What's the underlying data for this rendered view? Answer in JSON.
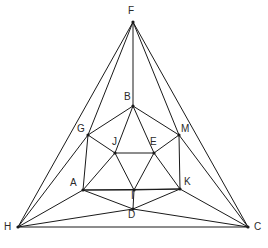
{
  "figure": {
    "background_color": "#ffffff",
    "line_color": "#1a1a1a",
    "label_color": "#2a2a2a",
    "width": 268,
    "height": 248,
    "vertices": [
      {
        "id": "F",
        "label": "F",
        "x": 133,
        "y": 22,
        "label_x": 128,
        "label_y": 6,
        "dot": true
      },
      {
        "id": "H",
        "label": "H",
        "x": 18,
        "y": 227,
        "label_x": 4,
        "label_y": 222,
        "dot": true
      },
      {
        "id": "C",
        "label": "C",
        "x": 248,
        "y": 227,
        "label_x": 254,
        "label_y": 222,
        "dot": true
      },
      {
        "id": "B",
        "label": "B",
        "x": 133,
        "y": 106,
        "label_x": 124,
        "label_y": 92,
        "dot": true
      },
      {
        "id": "G",
        "label": "G",
        "x": 88,
        "y": 135,
        "label_x": 77,
        "label_y": 124,
        "dot": true
      },
      {
        "id": "M",
        "label": "M",
        "x": 179,
        "y": 135,
        "label_x": 181,
        "label_y": 124,
        "dot": true
      },
      {
        "id": "J",
        "label": "J",
        "x": 115,
        "y": 153,
        "label_x": 112,
        "label_y": 137,
        "dot": true
      },
      {
        "id": "E",
        "label": "E",
        "x": 154,
        "y": 153,
        "label_x": 150,
        "label_y": 137,
        "dot": true
      },
      {
        "id": "A",
        "label": "A",
        "x": 83,
        "y": 190,
        "label_x": 70,
        "label_y": 178,
        "dot": true
      },
      {
        "id": "K",
        "label": "K",
        "x": 180,
        "y": 189,
        "label_x": 184,
        "label_y": 177,
        "dot": true
      },
      {
        "id": "I",
        "label": "I",
        "x": 134,
        "y": 190,
        "label_x": 131,
        "label_y": 191,
        "dot": true
      },
      {
        "id": "D",
        "label": "D",
        "x": 133,
        "y": 209,
        "label_x": 128,
        "label_y": 210,
        "dot": true
      }
    ],
    "edges": [
      {
        "from": "F",
        "to": "H"
      },
      {
        "from": "F",
        "to": "C"
      },
      {
        "from": "H",
        "to": "C"
      },
      {
        "from": "F",
        "to": "G"
      },
      {
        "from": "F",
        "to": "B"
      },
      {
        "from": "F",
        "to": "M"
      },
      {
        "from": "H",
        "to": "G"
      },
      {
        "from": "H",
        "to": "A"
      },
      {
        "from": "H",
        "to": "D"
      },
      {
        "from": "C",
        "to": "M"
      },
      {
        "from": "C",
        "to": "K"
      },
      {
        "from": "C",
        "to": "D"
      },
      {
        "from": "B",
        "to": "G"
      },
      {
        "from": "B",
        "to": "M"
      },
      {
        "from": "B",
        "to": "J"
      },
      {
        "from": "B",
        "to": "E"
      },
      {
        "from": "G",
        "to": "A"
      },
      {
        "from": "G",
        "to": "J"
      },
      {
        "from": "M",
        "to": "K"
      },
      {
        "from": "M",
        "to": "E"
      },
      {
        "from": "J",
        "to": "E"
      },
      {
        "from": "J",
        "to": "A"
      },
      {
        "from": "J",
        "to": "I"
      },
      {
        "from": "E",
        "to": "K"
      },
      {
        "from": "E",
        "to": "I"
      },
      {
        "from": "A",
        "to": "I"
      },
      {
        "from": "A",
        "to": "K"
      },
      {
        "from": "A",
        "to": "D"
      },
      {
        "from": "K",
        "to": "I"
      },
      {
        "from": "K",
        "to": "D"
      },
      {
        "from": "I",
        "to": "D"
      }
    ]
  }
}
